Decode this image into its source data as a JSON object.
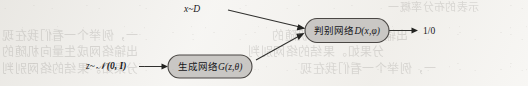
{
  "figure": {
    "kind": "gan-architecture-diagram",
    "width": 528,
    "height": 86,
    "nodes": [
      {
        "id": "discriminator",
        "label": "判别网络D(x,φ)",
        "label_cn": "判别网络",
        "label_math": "D(x,φ)",
        "shape": "rounded-rectangle",
        "fill": "#c9c7c4",
        "stroke": "#4a4744"
      },
      {
        "id": "generator",
        "label": "生成网络G(z,θ)",
        "label_cn": "生成网络",
        "label_math": "G(z,θ)",
        "shape": "rounded-rectangle",
        "fill": "#c9c7c4",
        "stroke": "#4a4744"
      }
    ],
    "edge_labels": {
      "real_data": "x~D",
      "real_data_var": "x",
      "real_data_dist": "D",
      "latent": "z~𝒩(0, I)",
      "latent_var": "z",
      "latent_dist": "𝒩",
      "latent_params": "(0, I)",
      "output": "1/0"
    },
    "edges": [
      {
        "id": "real-to-discriminator",
        "from": "x~D",
        "to": "discriminator"
      },
      {
        "id": "latent-to-generator",
        "from": "z~𝒩(0, I)",
        "to": "generator"
      },
      {
        "id": "generator-to-discriminator",
        "from": "generator",
        "to": "discriminator"
      },
      {
        "id": "discriminator-to-output",
        "from": "discriminator",
        "to": "1/0"
      }
    ],
    "bleed_through_lines": [
      "示表的布分率概一",
      "一，例举个一看们我在现",
      "出输络网成生量向机随的",
      "分果如。果结的络网别判"
    ]
  }
}
